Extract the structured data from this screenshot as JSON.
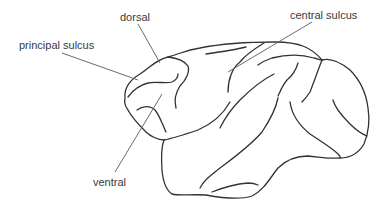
{
  "diagram": {
    "labels": {
      "dorsal": "dorsal",
      "principal_sulcus": "principal sulcus",
      "central_sulcus": "central sulcus",
      "ventral": "ventral"
    },
    "colors": {
      "outline": "#333333",
      "leader_line": "#6a6a6a",
      "text": "#3a3a3a",
      "background": "#ffffff"
    }
  }
}
